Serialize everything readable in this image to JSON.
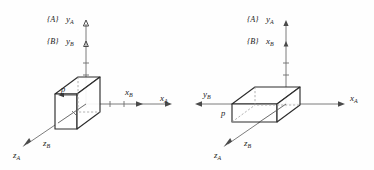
{
  "figure": {
    "background_color": "#fefefe",
    "line_color": "#2d2d2d",
    "axis_color": "#6e6e6e"
  },
  "panels": [
    {
      "id": "left",
      "name": "frame-b-translated",
      "frame_a_label": "{A}",
      "frame_b_label": "{B}",
      "vertical_axis_top_label": "y",
      "vertical_axis_top_sub": "A",
      "vertical_axis_mid_label": "y",
      "vertical_axis_mid_sub": "B",
      "horizontal_axis_inner_label": "x",
      "horizontal_axis_inner_sub": "B",
      "horizontal_axis_outer_label": "x",
      "horizontal_axis_outer_sub": "A",
      "depth_axis_outer_label": "z",
      "depth_axis_outer_sub": "A",
      "depth_axis_inner_label": "z",
      "depth_axis_inner_sub": "B",
      "point_label": "p"
    },
    {
      "id": "right",
      "name": "frame-b-rotated",
      "frame_a_label": "{A}",
      "frame_b_label": "{B}",
      "vertical_axis_top_label": "y",
      "vertical_axis_top_sub": "A",
      "vertical_axis_mid_label": "x",
      "vertical_axis_mid_sub": "B",
      "horizontal_axis_left_label": "y",
      "horizontal_axis_left_sub": "B",
      "horizontal_axis_outer_label": "x",
      "horizontal_axis_outer_sub": "A",
      "depth_axis_outer_label": "z",
      "depth_axis_outer_sub": "A",
      "depth_axis_inner_label": "z",
      "depth_axis_inner_sub": "B",
      "point_label": "p"
    }
  ]
}
